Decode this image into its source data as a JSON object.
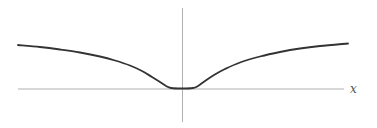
{
  "figure": {
    "x_axis_label": "x",
    "colors": {
      "axis": "#b0b0b0",
      "curve": "#333333",
      "label": "#555555"
    }
  },
  "chart_data": {
    "type": "line",
    "title": "",
    "xlabel": "x",
    "ylabel": "",
    "grid": false,
    "series": [
      {
        "name": "curve",
        "points_px": [
          [
            18,
            45
          ],
          [
            40,
            47
          ],
          [
            60,
            49.5
          ],
          [
            80,
            52.5
          ],
          [
            100,
            56.5
          ],
          [
            115,
            60.5
          ],
          [
            130,
            65.5
          ],
          [
            142,
            71
          ],
          [
            152,
            77
          ],
          [
            160,
            82
          ],
          [
            166,
            86
          ],
          [
            171,
            88
          ],
          [
            182,
            88.5
          ],
          [
            193,
            88
          ],
          [
            198,
            86
          ],
          [
            205,
            81
          ],
          [
            214,
            75
          ],
          [
            225,
            69
          ],
          [
            240,
            62.5
          ],
          [
            260,
            56.5
          ],
          [
            280,
            52
          ],
          [
            300,
            48.5
          ],
          [
            320,
            46
          ],
          [
            348,
            43.5
          ]
        ]
      }
    ],
    "axes": {
      "x_axis_y_px": 89,
      "y_axis_x_px": 182
    }
  }
}
